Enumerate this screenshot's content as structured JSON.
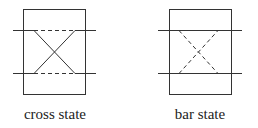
{
  "diagrams": [
    {
      "label": "cross state",
      "solid_path": "cross",
      "dashed_path": "bar"
    },
    {
      "label": "bar state",
      "solid_path": "bar",
      "dashed_path": "cross"
    }
  ],
  "colors": {
    "stroke": "#333333",
    "text": "#222222"
  }
}
